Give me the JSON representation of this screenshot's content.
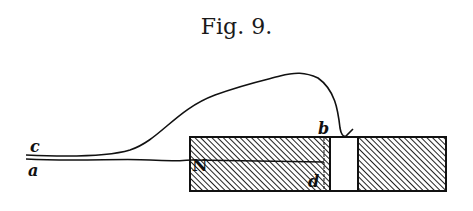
{
  "figure": {
    "title": "Fig. 9.",
    "labels": {
      "c": "c",
      "a": "a",
      "N": "N",
      "b": "b",
      "d": "d"
    },
    "colors": {
      "ink": "#1a1a1a",
      "background": "#ffffff"
    }
  }
}
